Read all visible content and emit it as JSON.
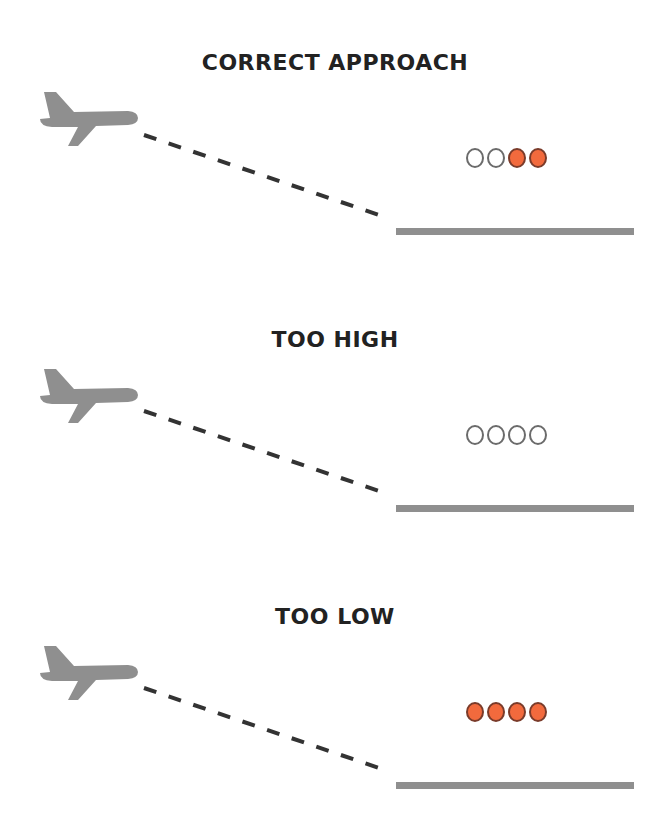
{
  "colors": {
    "plane": "#8f8f8f",
    "runway": "#8f8f8f",
    "glide_path": "#333333",
    "light_white": "#ffffff",
    "light_red": "#f26a3d",
    "title": "#222222"
  },
  "panels": [
    {
      "title": "CORRECT APPROACH",
      "papi_lights": [
        "white",
        "white",
        "red",
        "red"
      ],
      "icons": [
        "airplane-icon",
        "dashed-glide-path",
        "runway"
      ]
    },
    {
      "title": "TOO HIGH",
      "papi_lights": [
        "white",
        "white",
        "white",
        "white"
      ],
      "icons": [
        "airplane-icon",
        "dashed-glide-path",
        "runway"
      ]
    },
    {
      "title": "TOO LOW",
      "papi_lights": [
        "red",
        "red",
        "red",
        "red"
      ],
      "icons": [
        "airplane-icon",
        "dashed-glide-path",
        "runway"
      ]
    }
  ]
}
